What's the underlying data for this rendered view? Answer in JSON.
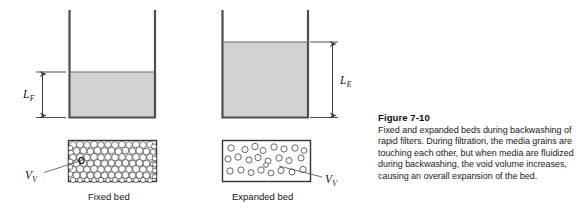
{
  "figure": {
    "title": "Figure 7-10",
    "caption": "Fixed and expanded beds during backwashing of rapid filters. During filtration, the media grains are touching each other, but when media are fluidized during backwashing, the void volume increases, causing an overall expansion of the bed."
  },
  "labels": {
    "fixed_bed_depth_symbol": "L",
    "fixed_bed_depth_subscript": "F",
    "expanded_bed_depth_symbol": "L",
    "expanded_bed_depth_subscript": "E",
    "void_volume_symbol": "V",
    "void_volume_subscript": "V",
    "fixed_bed_caption": "Fixed bed",
    "expanded_bed_caption": "Expanded bed"
  },
  "colors": {
    "media_fill": "#d2d2d2",
    "stroke": "#3b3b3b",
    "wall": "#555555",
    "grain_outline": "#4a4a4a",
    "background": "#ffffff",
    "text": "#1a1a1a"
  },
  "diagram": {
    "fixed_vessel": {
      "name": "fixed-bed-vessel",
      "left_wall_x": 68,
      "right_wall_x": 156,
      "wall_top_y": 10,
      "bottom_y": 118,
      "media_top_y": 72
    },
    "expanded_vessel": {
      "name": "expanded-bed-vessel",
      "left_wall_x": 222,
      "right_wall_x": 310,
      "wall_top_y": 10,
      "bottom_y": 118,
      "media_top_y": 42
    },
    "fixed_detail_box": {
      "x": 68,
      "y": 140,
      "width": 89,
      "height": 42,
      "grain_count": 165,
      "packing": "dense-touching"
    },
    "expanded_detail_box": {
      "x": 222,
      "y": 140,
      "width": 89,
      "height": 42,
      "grain_count": 25,
      "packing": "sparse-fluidized"
    }
  }
}
